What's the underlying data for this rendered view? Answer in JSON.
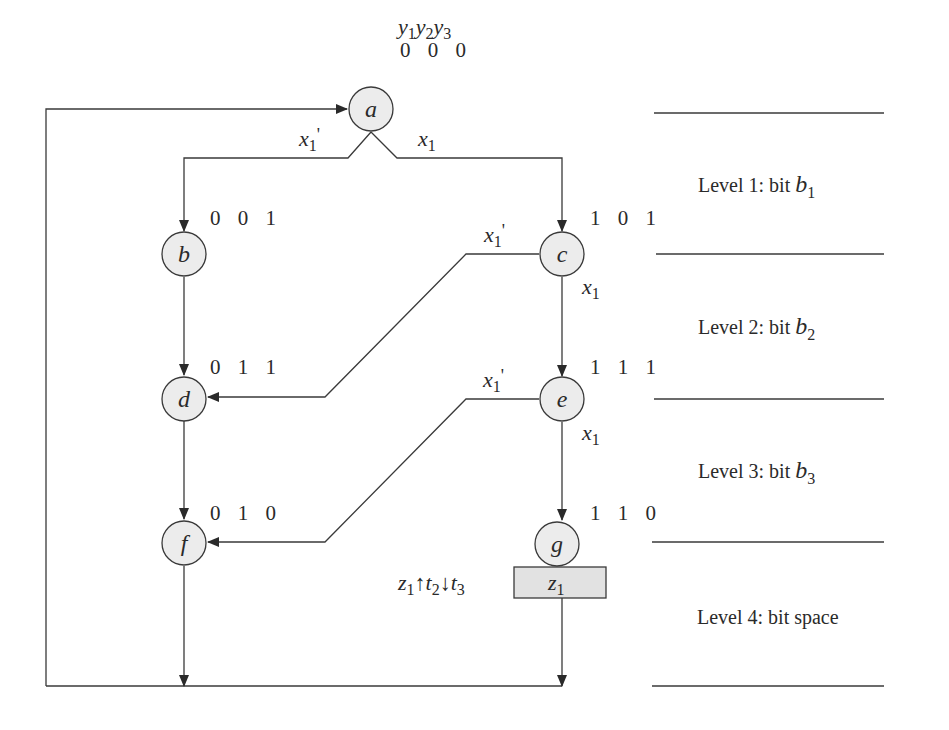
{
  "diagram": {
    "header_vars": {
      "y1": "y",
      "s1": "1",
      "y2": "y",
      "s2": "2",
      "y3": "y",
      "s3": "3"
    },
    "nodes": {
      "a": {
        "label": "a",
        "code": "0 0 0"
      },
      "b": {
        "label": "b",
        "code": "0 0 1"
      },
      "c": {
        "label": "c",
        "code": "1 0 1"
      },
      "d": {
        "label": "d",
        "code": "0 1 1"
      },
      "e": {
        "label": "e",
        "code": "1 1 1"
      },
      "f": {
        "label": "f",
        "code": "0 1 0"
      },
      "g": {
        "label": "g",
        "code": "1 1 0"
      }
    },
    "conditions": {
      "a_left": {
        "var": "x",
        "sub": "1",
        "prime": "'"
      },
      "a_right": {
        "var": "x",
        "sub": "1"
      },
      "c_left": {
        "var": "x",
        "sub": "1",
        "prime": "'"
      },
      "c_down": {
        "var": "x",
        "sub": "1"
      },
      "e_left": {
        "var": "x",
        "sub": "1",
        "prime": "'"
      },
      "e_down": {
        "var": "x",
        "sub": "1"
      }
    },
    "output_box": {
      "var": "z",
      "sub": "1"
    },
    "timing": {
      "z": "z",
      "zs": "1",
      "up": "↑",
      "t2": "t",
      "t2s": "2",
      "down": "↓",
      "t3": "t",
      "t3s": "3"
    },
    "levels": [
      {
        "text": "Level 1: bit ",
        "var": "b",
        "sub": "1"
      },
      {
        "text": "Level 2: bit ",
        "var": "b",
        "sub": "2"
      },
      {
        "text": "Level 3: bit ",
        "var": "b",
        "sub": "3"
      },
      {
        "text": "Level 4: bit space",
        "var": "",
        "sub": ""
      }
    ]
  }
}
